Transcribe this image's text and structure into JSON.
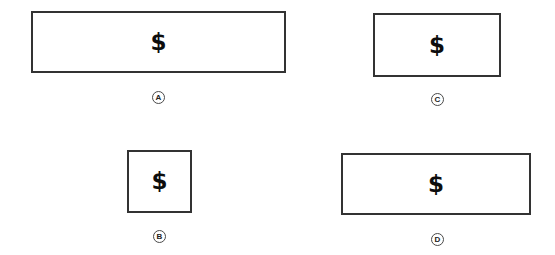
{
  "figure": {
    "background_color": "#ffffff",
    "border_color": "#333333",
    "symbol_color": "#0d0d0d",
    "label_circle_color": "#4a4a4a"
  },
  "options": [
    {
      "id": "a",
      "label": "A",
      "symbol": "$",
      "rect": {
        "x": 31,
        "y": 11,
        "width": 255,
        "height": 62
      },
      "label_position": {
        "x": 158,
        "y": 98
      }
    },
    {
      "id": "b",
      "label": "B",
      "symbol": "$",
      "rect": {
        "x": 127,
        "y": 150,
        "width": 65,
        "height": 63
      },
      "label_position": {
        "x": 159,
        "y": 237
      }
    },
    {
      "id": "c",
      "label": "C",
      "symbol": "$",
      "rect": {
        "x": 373,
        "y": 13,
        "width": 128,
        "height": 64
      },
      "label_position": {
        "x": 437,
        "y": 100
      }
    },
    {
      "id": "d",
      "label": "D",
      "symbol": "$",
      "rect": {
        "x": 341,
        "y": 153,
        "width": 190,
        "height": 62
      },
      "label_position": {
        "x": 437,
        "y": 240
      }
    }
  ]
}
